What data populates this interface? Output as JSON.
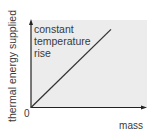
{
  "chart_data": {
    "type": "line",
    "title": "",
    "xlabel": "mass",
    "ylabel": "thermal energy supplied",
    "origin_label": "0",
    "annotation": [
      "constant",
      "temperature",
      "rise"
    ],
    "x": [
      0,
      1
    ],
    "series": [
      {
        "name": "constant temperature rise",
        "values": [
          0,
          1
        ]
      }
    ],
    "xlim": [
      0,
      1.45
    ],
    "ylim": [
      0,
      1.12
    ],
    "grid": false,
    "colors": {
      "background": "#ececec",
      "axis": "#222222",
      "line": "#333333",
      "text": "#3a3a3a"
    }
  }
}
